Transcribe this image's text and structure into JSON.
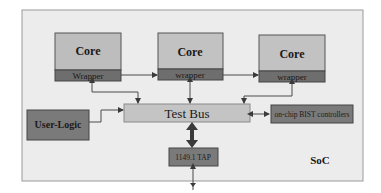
{
  "diagram": {
    "container_label": "SoC",
    "cores": [
      {
        "label": "Core",
        "wrapper_label": "Wrapper"
      },
      {
        "label": "Core",
        "wrapper_label": "wrapper"
      },
      {
        "label": "Core",
        "wrapper_label": "wrapper"
      }
    ],
    "test_bus_label": "Test Bus",
    "user_logic_label": "User-Logic",
    "bist_label": "on-chip BIST controllers",
    "tap_label": "1149.1 TAP",
    "colors": {
      "soc_bg": "#ececec",
      "soc_border": "#9a9a9a",
      "core_fill": "#bdbdbd",
      "wrapper_fill": "#6e6e6e",
      "test_bus_fill": "#c4c4c4",
      "dark_box_fill": "#7a7a7a",
      "line": "#4a4a4a"
    }
  }
}
